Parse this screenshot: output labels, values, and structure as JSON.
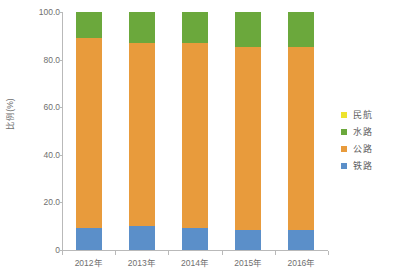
{
  "chart_data": {
    "type": "bar",
    "variant": "stacked-100-percent",
    "title": "",
    "subtitle": "",
    "xlabel": "",
    "ylabel": "比例(%)",
    "ylim": [
      0,
      100
    ],
    "yticks": [
      "0",
      "20.0",
      "40.0",
      "60.0",
      "80.0",
      "100.0"
    ],
    "ytick_values": [
      0,
      20,
      40,
      60,
      80,
      100
    ],
    "grid": false,
    "legend_position": "right",
    "categories": [
      "2012年",
      "2013年",
      "2014年",
      "2015年",
      "2016年"
    ],
    "series": [
      {
        "name": "铁路",
        "color": "#5B8FC9",
        "values": [
          9.4,
          9.9,
          9.1,
          8.6,
          8.4
        ]
      },
      {
        "name": "公路",
        "color": "#E89B3C",
        "values": [
          79.6,
          76.9,
          77.9,
          76.7,
          77.1
        ]
      },
      {
        "name": "水路",
        "color": "#6BA83C",
        "values": [
          10.9,
          13.1,
          12.9,
          14.6,
          14.4
        ]
      },
      {
        "name": "民航",
        "color": "#EDE32E",
        "values": [
          0.1,
          0.1,
          0.1,
          0.1,
          0.1
        ]
      }
    ],
    "legend_order": [
      "民航",
      "水路",
      "公路",
      "铁路"
    ],
    "axis_color": "#b9b9b9",
    "text_color": "#6f6f6f",
    "background": "#ffffff"
  }
}
